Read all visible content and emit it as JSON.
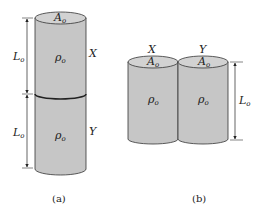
{
  "figure_a": {
    "caption": "(a)",
    "area_label": "A",
    "area_sub": "o",
    "top_cylinder": {
      "name": "X",
      "density": "ρ",
      "density_sub": "o",
      "length": "L",
      "length_sub": "o"
    },
    "bottom_cylinder": {
      "name": "Y",
      "density": "ρ",
      "density_sub": "o",
      "length": "L",
      "length_sub": "o"
    }
  },
  "figure_b": {
    "caption": "(b)",
    "length": "L",
    "length_sub": "o",
    "left_cylinder": {
      "name": "X",
      "area": "A",
      "area_sub": "o",
      "density": "ρ",
      "density_sub": "o"
    },
    "right_cylinder": {
      "name": "Y",
      "area": "A",
      "area_sub": "o",
      "density": "ρ",
      "density_sub": "o"
    }
  },
  "colors": {
    "fill": "#c8c8c8",
    "stroke": "#333333",
    "top_fill": "#d4d4d4"
  }
}
